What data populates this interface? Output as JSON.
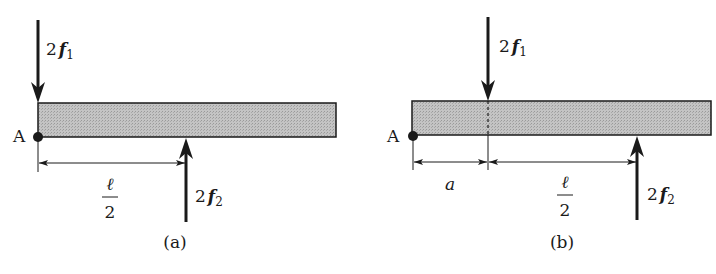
{
  "colors": {
    "ink": "#1a1a1a",
    "beam_fill": "#bdbdbd",
    "background": "#ffffff"
  },
  "diagram_a": {
    "caption": "(a)",
    "point_label": "A",
    "force_top": {
      "coef": "2",
      "symbol": "f",
      "subscript": "1",
      "direction": "down"
    },
    "force_bottom": {
      "coef": "2",
      "symbol": "f",
      "subscript": "2",
      "direction": "up"
    },
    "dimension": {
      "numerator": "ℓ",
      "denominator": "2"
    }
  },
  "diagram_b": {
    "caption": "(b)",
    "point_label": "A",
    "force_top": {
      "coef": "2",
      "symbol": "f",
      "subscript": "1",
      "direction": "down"
    },
    "force_bottom": {
      "coef": "2",
      "symbol": "f",
      "subscript": "2",
      "direction": "up"
    },
    "dimension_1": {
      "label": "a"
    },
    "dimension_2": {
      "numerator": "ℓ",
      "denominator": "2"
    }
  }
}
